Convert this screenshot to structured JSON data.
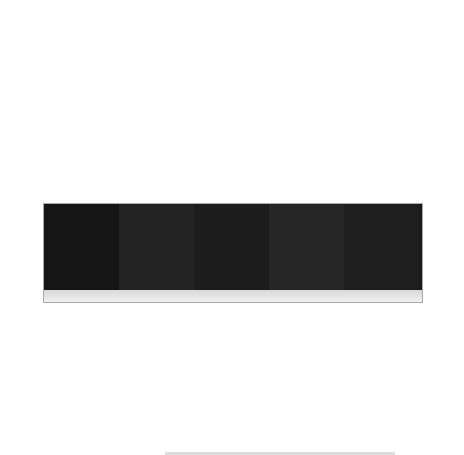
{
  "chart_data": [
    {
      "panel": "(a)",
      "type": "bar",
      "title": "",
      "xlabel": "",
      "ylabel": "经济产量(g)",
      "ylim": [
        50,
        300
      ],
      "yticks": [
        50,
        100,
        150,
        200,
        250,
        300
      ],
      "categories": [
        "Water",
        "CF",
        "BS",
        "CBS",
        "13CBS"
      ],
      "values": [
        117,
        180,
        243,
        262,
        258
      ],
      "errors": [
        31,
        21,
        8,
        12,
        7
      ],
      "significance_letters": [
        "C",
        "B",
        "A",
        "A",
        "A"
      ],
      "bar_color": "#8c8c8c",
      "grid": false,
      "legend": null
    },
    {
      "panel": "(b)",
      "type": "bar",
      "title": "",
      "xlabel": "",
      "ylabel": "收获指数",
      "y_axis_side": "right",
      "ylim": [
        0.53,
        0.67
      ],
      "yticks": [
        0.54,
        0.56,
        0.58,
        0.6,
        0.62,
        0.64,
        0.66
      ],
      "categories": [
        "Water",
        "CF",
        "BS",
        "CBS",
        "13CBS"
      ],
      "values": [
        0.579,
        0.608,
        0.623,
        0.618,
        0.64
      ],
      "errors": [
        0.004,
        0.003,
        0.002,
        0.003,
        0.002
      ],
      "significance_letters": [
        "D",
        "C",
        "B",
        "B",
        "A"
      ],
      "bar_color": "#ececec",
      "grid": false,
      "legend": null
    }
  ],
  "panel_c": {
    "label": "(c)",
    "treatments": [
      "Water",
      "CF",
      "BS",
      "CBS",
      "13CBS"
    ]
  }
}
